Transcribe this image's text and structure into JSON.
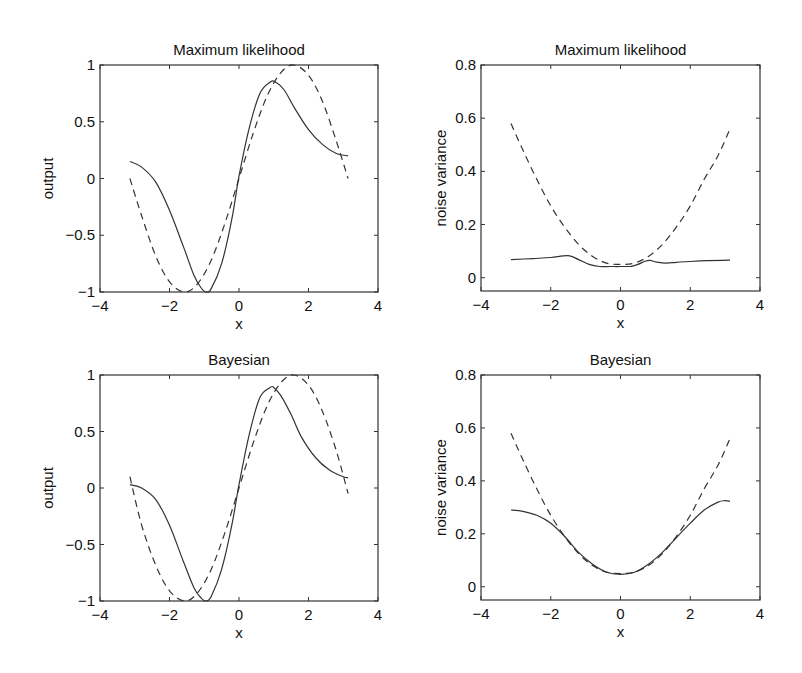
{
  "chart_data": [
    {
      "id": "top-left",
      "type": "line",
      "title": "Maximum likelihood",
      "xlabel": "x",
      "ylabel": "output",
      "xlim": [
        -4,
        4
      ],
      "ylim": [
        -1,
        1
      ],
      "xticks": [
        -4,
        -2,
        0,
        2,
        4
      ],
      "xtick_labels": [
        "−4",
        "−2",
        "0",
        "2",
        "4"
      ],
      "yticks": [
        -1,
        -0.5,
        0,
        0.5,
        1
      ],
      "ytick_labels": [
        "−1",
        "−0.5",
        "0",
        "0.5",
        "1"
      ],
      "grid": false,
      "box": {
        "left": 100,
        "right": 378,
        "top": 65,
        "bottom": 292
      },
      "series": [
        {
          "name": "true function (sin x)",
          "style": "dashed",
          "x": [
            -3.14,
            -2.8,
            -2.4,
            -2.0,
            -1.57,
            -1.2,
            -0.8,
            -0.4,
            0,
            0.4,
            0.8,
            1.2,
            1.57,
            2.0,
            2.4,
            2.8,
            3.14
          ],
          "y": [
            0.0,
            -0.33,
            -0.68,
            -0.91,
            -1.0,
            -0.93,
            -0.72,
            -0.39,
            0.0,
            0.39,
            0.72,
            0.93,
            1.0,
            0.91,
            0.68,
            0.33,
            0.0
          ]
        },
        {
          "name": "maximum likelihood fit",
          "style": "solid",
          "x": [
            -3.14,
            -2.8,
            -2.4,
            -2.0,
            -1.6,
            -1.3,
            -1.1,
            -0.95,
            -0.8,
            -0.5,
            -0.2,
            0,
            0.3,
            0.6,
            0.9,
            1.05,
            1.3,
            1.6,
            2.0,
            2.4,
            2.8,
            3.14
          ],
          "y": [
            0.15,
            0.1,
            -0.03,
            -0.28,
            -0.6,
            -0.85,
            -0.96,
            -1.0,
            -0.97,
            -0.75,
            -0.35,
            0.02,
            0.45,
            0.75,
            0.85,
            0.85,
            0.78,
            0.62,
            0.43,
            0.3,
            0.22,
            0.2
          ]
        }
      ]
    },
    {
      "id": "top-right",
      "type": "line",
      "title": "Maximum likelihood",
      "xlabel": "x",
      "ylabel": "noise variance",
      "xlim": [
        -4,
        4
      ],
      "ylim": [
        -0.05,
        0.8
      ],
      "xticks": [
        -4,
        -2,
        0,
        2,
        4
      ],
      "xtick_labels": [
        "−4",
        "−2",
        "0",
        "2",
        "4"
      ],
      "yticks": [
        0,
        0.2,
        0.4,
        0.6,
        0.8
      ],
      "ytick_labels": [
        "0",
        "0.2",
        "0.4",
        "0.6",
        "0.8"
      ],
      "grid": false,
      "box": {
        "left": 481,
        "right": 760,
        "top": 65,
        "bottom": 291
      },
      "series": [
        {
          "name": "true noise variance",
          "style": "dashed",
          "x": [
            -3.14,
            -2.8,
            -2.4,
            -2.0,
            -1.6,
            -1.2,
            -0.8,
            -0.4,
            0,
            0.4,
            0.8,
            1.2,
            1.6,
            2.0,
            2.4,
            2.8,
            3.14
          ],
          "y": [
            0.58,
            0.48,
            0.37,
            0.27,
            0.19,
            0.125,
            0.08,
            0.055,
            0.05,
            0.055,
            0.08,
            0.125,
            0.19,
            0.27,
            0.37,
            0.46,
            0.56
          ]
        },
        {
          "name": "maximum likelihood estimate",
          "style": "solid",
          "x": [
            -3.14,
            -2.5,
            -2.0,
            -1.5,
            -1.2,
            -0.9,
            -0.6,
            -0.3,
            0,
            0.3,
            0.5,
            0.7,
            0.85,
            1.0,
            1.3,
            1.6,
            2.0,
            2.5,
            3.14
          ],
          "y": [
            0.068,
            0.072,
            0.076,
            0.083,
            0.068,
            0.05,
            0.042,
            0.042,
            0.042,
            0.043,
            0.05,
            0.062,
            0.065,
            0.06,
            0.055,
            0.058,
            0.061,
            0.064,
            0.066
          ]
        }
      ]
    },
    {
      "id": "bottom-left",
      "type": "line",
      "title": "Bayesian",
      "xlabel": "x",
      "ylabel": "output",
      "xlim": [
        -4,
        4
      ],
      "ylim": [
        -1,
        1
      ],
      "xticks": [
        -4,
        -2,
        0,
        2,
        4
      ],
      "xtick_labels": [
        "−4",
        "−2",
        "0",
        "2",
        "4"
      ],
      "yticks": [
        -1,
        -0.5,
        0,
        0.5,
        1
      ],
      "ytick_labels": [
        "−1",
        "−0.5",
        "0",
        "0.5",
        "1"
      ],
      "grid": false,
      "box": {
        "left": 100,
        "right": 378,
        "top": 375,
        "bottom": 601
      },
      "series": [
        {
          "name": "true function (sin x)",
          "style": "dashed",
          "x": [
            -3.14,
            -2.8,
            -2.4,
            -2.0,
            -1.57,
            -1.2,
            -0.8,
            -0.4,
            0,
            0.4,
            0.8,
            1.2,
            1.57,
            2.0,
            2.4,
            2.8,
            3.14
          ],
          "y": [
            0.1,
            -0.33,
            -0.68,
            -0.91,
            -1.0,
            -0.93,
            -0.72,
            -0.39,
            0.0,
            0.39,
            0.72,
            0.93,
            1.0,
            0.91,
            0.68,
            0.33,
            -0.05
          ]
        },
        {
          "name": "Bayesian fit",
          "style": "solid",
          "x": [
            -3.14,
            -2.8,
            -2.4,
            -2.0,
            -1.6,
            -1.3,
            -1.1,
            -0.95,
            -0.8,
            -0.5,
            -0.2,
            0,
            0.3,
            0.6,
            0.9,
            1.0,
            1.2,
            1.5,
            1.8,
            2.2,
            2.6,
            3.0,
            3.14
          ],
          "y": [
            0.03,
            0.0,
            -0.1,
            -0.33,
            -0.65,
            -0.88,
            -0.97,
            -1.0,
            -0.96,
            -0.72,
            -0.32,
            0.03,
            0.48,
            0.8,
            0.89,
            0.89,
            0.82,
            0.65,
            0.45,
            0.27,
            0.16,
            0.1,
            0.09
          ]
        }
      ]
    },
    {
      "id": "bottom-right",
      "type": "line",
      "title": "Bayesian",
      "xlabel": "x",
      "ylabel": "noise variance",
      "xlim": [
        -4,
        4
      ],
      "ylim": [
        -0.05,
        0.8
      ],
      "xticks": [
        -4,
        -2,
        0,
        2,
        4
      ],
      "xtick_labels": [
        "−4",
        "−2",
        "0",
        "2",
        "4"
      ],
      "yticks": [
        0,
        0.2,
        0.4,
        0.6,
        0.8
      ],
      "ytick_labels": [
        "0",
        "0.2",
        "0.4",
        "0.6",
        "0.8"
      ],
      "grid": false,
      "box": {
        "left": 481,
        "right": 760,
        "top": 375,
        "bottom": 600
      },
      "series": [
        {
          "name": "true noise variance",
          "style": "dashed",
          "x": [
            -3.14,
            -2.8,
            -2.4,
            -2.0,
            -1.6,
            -1.2,
            -0.8,
            -0.4,
            0,
            0.4,
            0.8,
            1.2,
            1.6,
            2.0,
            2.4,
            2.8,
            3.14
          ],
          "y": [
            0.58,
            0.48,
            0.37,
            0.27,
            0.19,
            0.125,
            0.08,
            0.055,
            0.05,
            0.055,
            0.08,
            0.125,
            0.19,
            0.27,
            0.37,
            0.46,
            0.56
          ]
        },
        {
          "name": "Bayesian estimate",
          "style": "solid",
          "x": [
            -3.14,
            -2.8,
            -2.4,
            -2.0,
            -1.6,
            -1.2,
            -0.8,
            -0.4,
            0,
            0.4,
            0.8,
            1.2,
            1.6,
            2.0,
            2.4,
            2.8,
            3.0,
            3.14
          ],
          "y": [
            0.29,
            0.285,
            0.27,
            0.24,
            0.19,
            0.13,
            0.085,
            0.055,
            0.047,
            0.055,
            0.085,
            0.13,
            0.185,
            0.24,
            0.29,
            0.32,
            0.325,
            0.323
          ]
        }
      ]
    }
  ]
}
